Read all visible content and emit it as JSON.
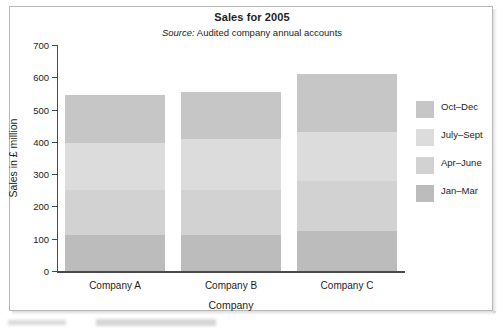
{
  "chart_data": {
    "type": "bar",
    "subtype": "stacked-bar",
    "title": "Sales for 2005",
    "subtitle_prefix": "Source:",
    "subtitle_text": " Audited company annual accounts",
    "xlabel": "Company",
    "ylabel": "Sales in £ million",
    "categories": [
      "Company A",
      "Company B",
      "Company C"
    ],
    "ylim": [
      0,
      700
    ],
    "yticks": [
      700,
      600,
      500,
      400,
      300,
      200,
      100,
      0
    ],
    "ytick_labels": [
      "700",
      "600",
      "500",
      "400",
      "300",
      "200",
      "100",
      "0"
    ],
    "grid": false,
    "legend_position": "right",
    "series": [
      {
        "name": "Jan–Mar",
        "values": [
          112,
          113,
          125
        ],
        "color": "#bcbcbc"
      },
      {
        "name": "Apr–June",
        "values": [
          138,
          137,
          153
        ],
        "color": "#d2d2d2"
      },
      {
        "name": "July–Sept",
        "values": [
          148,
          158,
          152
        ],
        "color": "#dcdcdc"
      },
      {
        "name": "Oct–Dec",
        "values": [
          147,
          147,
          180
        ],
        "color": "#c6c6c6"
      }
    ],
    "totals": [
      545,
      555,
      610
    ],
    "legend_order_top_to_bottom": [
      "Oct–Dec",
      "July–Sept",
      "Apr–June",
      "Jan–Mar"
    ]
  }
}
